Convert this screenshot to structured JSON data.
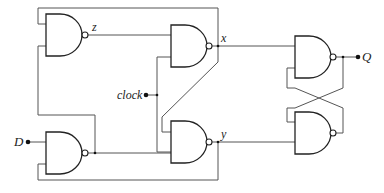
{
  "diagram": {
    "type": "logic-circuit",
    "colors": {
      "wire": "#555555",
      "gate_outline": "#222222",
      "background": "#ffffff"
    },
    "labels": {
      "z": "z",
      "x": "x",
      "y": "y",
      "clock": "clock",
      "D": "D",
      "Q": "Q"
    },
    "gates": [
      {
        "id": "g1",
        "type": "NAND",
        "output": "z"
      },
      {
        "id": "g2",
        "type": "NAND",
        "output": "x"
      },
      {
        "id": "g3",
        "type": "NAND",
        "output": "y"
      },
      {
        "id": "g4",
        "type": "NAND",
        "input": "D"
      },
      {
        "id": "g5",
        "type": "NAND",
        "output": "Q"
      },
      {
        "id": "g6",
        "type": "NAND"
      }
    ],
    "inputs": [
      "D",
      "clock"
    ],
    "outputs": [
      "Q"
    ]
  }
}
